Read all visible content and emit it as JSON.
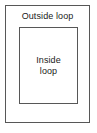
{
  "diagram": {
    "type": "nested-rectangles",
    "title": null,
    "background_color": "#ffffff",
    "stroke_color": "#575757",
    "text_color": "#1a1a1a",
    "outer": {
      "label": "Outside loop",
      "label_position": "top-center"
    },
    "inner": {
      "label_line_1": "Inside",
      "label_line_2": "loop",
      "label_position": "center"
    }
  }
}
